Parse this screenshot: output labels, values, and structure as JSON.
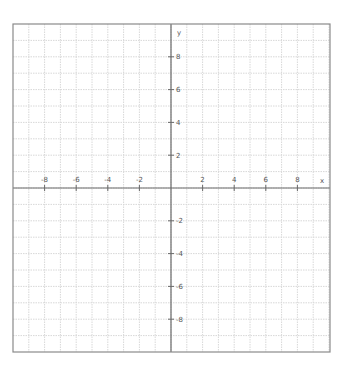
{
  "chart_data": {
    "type": "line",
    "title": "",
    "xlabel": "x",
    "ylabel": "y",
    "xlim": [
      -10,
      10
    ],
    "ylim": [
      -10,
      10
    ],
    "grid": true,
    "grid_step": 1,
    "x_ticks": [
      -8,
      -6,
      -4,
      -2,
      2,
      4,
      6,
      8
    ],
    "y_ticks": [
      8,
      6,
      4,
      2,
      -2,
      -4,
      -6,
      -8
    ],
    "series": []
  },
  "colors": {
    "frame": "#8a8a8a",
    "grid": "#d8d8d8",
    "axis": "#6a6a6a",
    "label": "#555555"
  }
}
